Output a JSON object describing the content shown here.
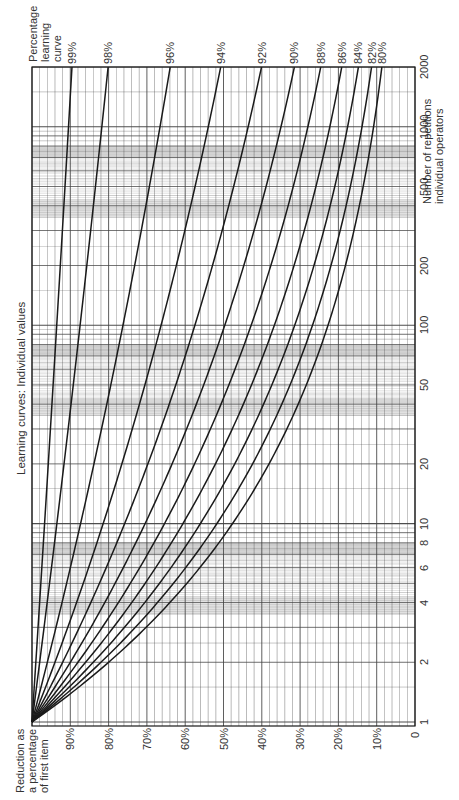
{
  "chart_data": {
    "type": "line",
    "title": "Learning curves: Individual values",
    "orientation": "rotated 90° counter-clockwise",
    "xlabel": "Number of repetitions individual operators",
    "x_axis_label_lines": [
      "Number of repetitions",
      "individual operators"
    ],
    "ylabel": "Reduction as a percentage of first item",
    "y_axis_label_lines": [
      "Reduction as",
      "a percentage",
      "of first item"
    ],
    "series_legend_title_lines": [
      "Percentage",
      "learning",
      "curve"
    ],
    "x_scale": "log",
    "xlim": [
      1,
      2000
    ],
    "ylim": [
      0,
      100
    ],
    "grid": true,
    "x_ticks": [
      1,
      2,
      4,
      6,
      8,
      10,
      20,
      50,
      100,
      200,
      500,
      1000,
      2000
    ],
    "x_tick_labels": [
      "1",
      "2",
      "4",
      "6",
      "8",
      "10",
      "20",
      "50",
      "100",
      "200",
      "500",
      "1000",
      "2000"
    ],
    "y_ticks": [
      0,
      10,
      20,
      30,
      40,
      50,
      60,
      70,
      80,
      90
    ],
    "y_tick_labels": [
      "0",
      "10%",
      "20%",
      "30%",
      "40%",
      "50%",
      "60%",
      "70%",
      "80%",
      "90%"
    ],
    "formula": "y = 100 * x^(log2(rate))",
    "series": [
      {
        "name": "99%",
        "rate": 0.99,
        "values_at_ticks": [
          100,
          99.0,
          98.0,
          97.4,
          97.0,
          96.7,
          95.7,
          94.5,
          93.6,
          92.7,
          91.5,
          90.6,
          89.7
        ]
      },
      {
        "name": "98%",
        "rate": 0.98,
        "values_at_ticks": [
          100,
          98.0,
          96.0,
          94.9,
          94.1,
          93.5,
          91.6,
          89.2,
          87.5,
          85.7,
          83.5,
          81.8,
          80.2
        ]
      },
      {
        "name": "96%",
        "rate": 0.96,
        "values_at_ticks": [
          100,
          96.0,
          92.2,
          90.0,
          88.5,
          87.3,
          83.8,
          79.6,
          76.3,
          73.3,
          69.6,
          66.8,
          64.1
        ]
      },
      {
        "name": "94%",
        "rate": 0.94,
        "values_at_ticks": [
          100,
          94.0,
          88.4,
          85.2,
          83.1,
          81.4,
          76.5,
          70.6,
          66.3,
          62.3,
          57.3,
          53.8,
          50.6
        ]
      },
      {
        "name": "92%",
        "rate": 0.92,
        "values_at_ticks": [
          100,
          92.0,
          84.6,
          80.6,
          77.9,
          75.8,
          69.7,
          62.6,
          57.4,
          52.8,
          47.3,
          43.5,
          40.0
        ]
      },
      {
        "name": "90%",
        "rate": 0.9,
        "values_at_ticks": [
          100,
          90.0,
          81.0,
          76.3,
          72.9,
          70.5,
          63.4,
          55.3,
          49.8,
          44.8,
          39.0,
          35.1,
          31.6
        ]
      },
      {
        "name": "88%",
        "rate": 0.88,
        "values_at_ticks": [
          100,
          88.0,
          77.4,
          72.0,
          68.1,
          65.5,
          57.6,
          48.8,
          43.0,
          37.8,
          31.9,
          28.1,
          24.7
        ]
      },
      {
        "name": "86%",
        "rate": 0.86,
        "values_at_ticks": [
          100,
          86.0,
          74.0,
          67.9,
          63.6,
          60.7,
          52.2,
          43.0,
          37.0,
          31.8,
          26.1,
          22.4,
          19.3
        ]
      },
      {
        "name": "84%",
        "rate": 0.84,
        "values_at_ticks": [
          100,
          84.0,
          70.6,
          64.0,
          59.3,
          56.1,
          47.2,
          37.8,
          31.5,
          26.5,
          21.0,
          17.7,
          14.9
        ]
      },
      {
        "name": "82%",
        "rate": 0.82,
        "values_at_ticks": [
          100,
          82.0,
          67.2,
          60.2,
          55.1,
          51.8,
          42.5,
          32.9,
          26.9,
          22.1,
          16.9,
          13.9,
          11.4
        ]
      },
      {
        "name": "80%",
        "rate": 0.8,
        "values_at_ticks": [
          100,
          80.0,
          64.0,
          56.2,
          51.2,
          47.7,
          38.1,
          28.6,
          22.7,
          18.2,
          13.4,
          10.8,
          8.7
        ]
      }
    ]
  },
  "labels": {
    "title": "Learning curves: Individual values",
    "legend_title": [
      "Percentage",
      "learning",
      "curve"
    ],
    "x_axis": [
      "Number of repetitions",
      "individual operators"
    ],
    "y_axis": [
      "Reduction as",
      "a percentage",
      "of first item"
    ]
  },
  "layout": {
    "frame": {
      "left": 32,
      "top": 67,
      "right": 415,
      "bottom": 726
    },
    "origin_y": 722,
    "px_per_decade": 198.4,
    "line_color": "#1a1a1a",
    "grid_color": "#444444",
    "band_color": "#bdbdbd"
  }
}
